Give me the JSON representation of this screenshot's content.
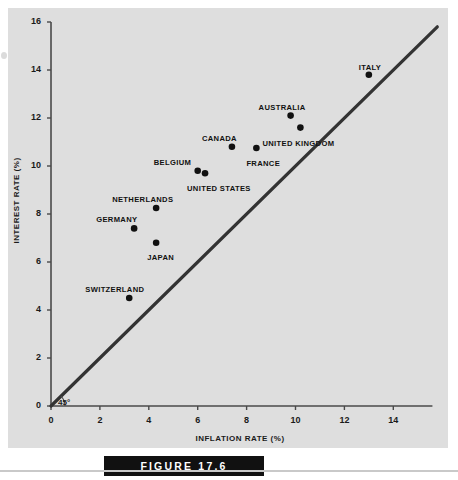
{
  "figure": {
    "caption": "FIGURE 17.6"
  },
  "chart_data": {
    "type": "scatter",
    "title": "",
    "xlabel": "INFLATION RATE (%)",
    "ylabel": "INTEREST RATE (%)",
    "xlim": [
      0,
      15.6
    ],
    "ylim": [
      0,
      16
    ],
    "xticks": [
      0,
      2,
      4,
      6,
      8,
      10,
      12,
      14
    ],
    "yticks": [
      0,
      2,
      4,
      6,
      8,
      10,
      12,
      14,
      16
    ],
    "xtick_labels": [
      "0",
      "2",
      "4",
      "6",
      "8",
      "10",
      "12",
      "14"
    ],
    "ytick_labels": [
      "0",
      "2",
      "4",
      "6",
      "8",
      "10",
      "12",
      "14",
      "16"
    ],
    "grid": false,
    "legend": "none",
    "marker_color": "#111111",
    "line_color": "#333333",
    "background_color": "#dedede",
    "points": [
      {
        "label": "SWITZERLAND",
        "x": 3.2,
        "y": 4.5,
        "label_dx": -44,
        "label_dy": -13
      },
      {
        "label": "GERMANY",
        "x": 3.4,
        "y": 7.4,
        "label_dx": -38,
        "label_dy": -13
      },
      {
        "label": "JAPAN",
        "x": 4.3,
        "y": 6.8,
        "label_dx": -9,
        "label_dy": 10
      },
      {
        "label": "NETHERLANDS",
        "x": 4.3,
        "y": 8.25,
        "label_dx": -44,
        "label_dy": -13
      },
      {
        "label": "BELGIUM",
        "x": 6.0,
        "y": 9.8,
        "label_dx": -44,
        "label_dy": -13
      },
      {
        "label": "UNITED STATES",
        "x": 6.3,
        "y": 9.7,
        "label_dx": -18,
        "label_dy": 11
      },
      {
        "label": "CANADA",
        "x": 7.4,
        "y": 10.8,
        "label_dx": -30,
        "label_dy": -13
      },
      {
        "label": "FRANCE",
        "x": 8.4,
        "y": 10.75,
        "label_dx": -10,
        "label_dy": 11
      },
      {
        "label": "AUSTRALIA",
        "x": 9.8,
        "y": 12.1,
        "label_dx": -32,
        "label_dy": -13
      },
      {
        "label": "UNITED KINGDOM",
        "x": 10.2,
        "y": 11.6,
        "label_dx": -38,
        "label_dy": 11
      },
      {
        "label": "ITALY",
        "x": 13.0,
        "y": 13.8,
        "label_dx": -10,
        "label_dy": -12
      }
    ],
    "reference_line": {
      "annotation": "45°",
      "from": [
        0,
        0
      ],
      "to": [
        15.8,
        15.8
      ],
      "description": "45 degree line"
    }
  }
}
